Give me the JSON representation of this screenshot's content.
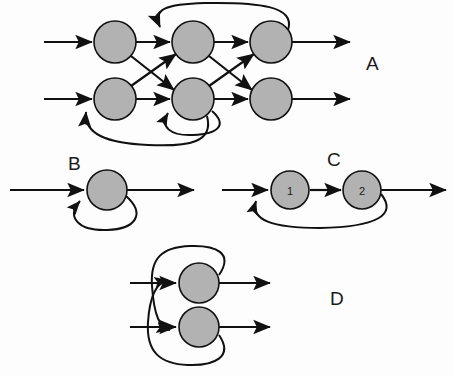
{
  "figure": {
    "background_color": "#fdfdfd",
    "node_fill_color": "#b2b2b2",
    "node_stroke_color": "#111111",
    "edge_color": "#111111",
    "width": 454,
    "height": 375
  },
  "panels": [
    {
      "id": "A",
      "label": "A",
      "label_x": 366,
      "label_y": 70,
      "description": "Three-layer fully connected network with two units per layer, feedback arcs and a self-loop",
      "nodes": [
        {
          "id": "a11",
          "label": "",
          "cx": 115,
          "cy": 42,
          "r": 21
        },
        {
          "id": "a12",
          "label": "",
          "cx": 115,
          "cy": 99,
          "r": 21
        },
        {
          "id": "a21",
          "label": "",
          "cx": 193,
          "cy": 42,
          "r": 21
        },
        {
          "id": "a22",
          "label": "",
          "cx": 193,
          "cy": 99,
          "r": 21
        },
        {
          "id": "a31",
          "label": "",
          "cx": 271,
          "cy": 42,
          "r": 21
        },
        {
          "id": "a32",
          "label": "",
          "cx": 271,
          "cy": 99,
          "r": 21
        }
      ],
      "input_arrows": [
        {
          "from_x": 44,
          "to_x": 94,
          "y": 42
        },
        {
          "from_x": 44,
          "to_x": 94,
          "y": 99
        }
      ],
      "output_arrows": [
        {
          "from_x": 292,
          "to_x": 352,
          "y": 42
        },
        {
          "from_x": 292,
          "to_x": 352,
          "y": 99
        }
      ]
    },
    {
      "id": "B",
      "label": "B",
      "label_x": 68,
      "label_y": 170,
      "description": "Single unit with a self-recurrent connection",
      "nodes": [
        {
          "id": "b1",
          "label": "",
          "cx": 107,
          "cy": 190,
          "r": 20
        }
      ],
      "input_arrows": [
        {
          "from_x": 10,
          "to_x": 86,
          "y": 190
        }
      ],
      "output_arrows": [
        {
          "from_x": 127,
          "to_x": 196,
          "y": 190
        }
      ]
    },
    {
      "id": "C",
      "label": "C",
      "label_x": 327,
      "label_y": 166,
      "description": "Two units in series with a feedback connection from unit 2 back to unit 1",
      "nodes": [
        {
          "id": "c1",
          "label": "1",
          "cx": 290,
          "cy": 190,
          "r": 19
        },
        {
          "id": "c2",
          "label": "2",
          "cx": 362,
          "cy": 190,
          "r": 19
        }
      ],
      "input_arrows": [
        {
          "from_x": 222,
          "to_x": 270,
          "y": 190
        }
      ],
      "output_arrows": [
        {
          "from_x": 381,
          "to_x": 448,
          "y": 190
        }
      ]
    },
    {
      "id": "D",
      "label": "D",
      "label_x": 330,
      "label_y": 305,
      "description": "Two units with mutual cross-coupled feedback connections",
      "nodes": [
        {
          "id": "d1",
          "label": "",
          "cx": 199,
          "cy": 283,
          "r": 20
        },
        {
          "id": "d2",
          "label": "",
          "cx": 199,
          "cy": 327,
          "r": 20
        }
      ],
      "input_arrows": [
        {
          "from_x": 130,
          "to_x": 178,
          "y": 283
        },
        {
          "from_x": 130,
          "to_x": 178,
          "y": 327
        }
      ],
      "output_arrows": [
        {
          "from_x": 219,
          "to_x": 272,
          "y": 283
        },
        {
          "from_x": 219,
          "to_x": 327,
          "y": 327
        }
      ]
    }
  ]
}
